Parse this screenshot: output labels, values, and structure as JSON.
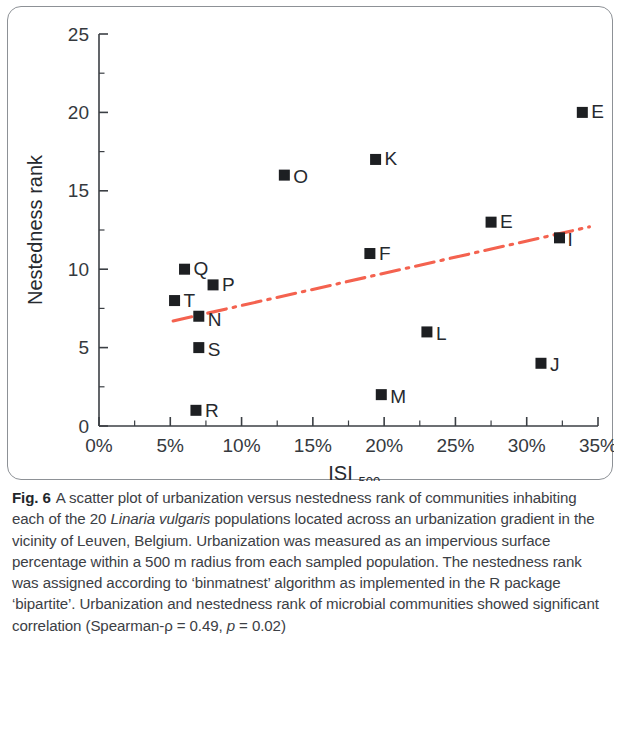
{
  "figure": {
    "number": "Fig. 6",
    "caption_part1": "A scatter plot of urbanization versus nestedness rank of communities inhabiting each of the 20 ",
    "caption_species": "Linaria vulgaris",
    "caption_part2": " populations located across an urbanization gradient in the vicinity of Leuven, Belgium. Urbanization was measured as an impervious surface percentage within a 500 m radius from each sampled population. The nestedness rank was assigned according to ‘binmatnest’ algorithm as implemented in the R package ‘bipartite’. Urbanization and nestedness rank of microbial communities showed significant correlation (Spearman-ρ = 0.49, ",
    "caption_pital": "p",
    "caption_part3": " = 0.02)"
  },
  "chart_data": {
    "type": "scatter",
    "title": "",
    "xlabel": "ISI",
    "xlabel_subscript": "500",
    "ylabel": "Nestedness rank",
    "xlim": [
      0,
      35
    ],
    "ylim": [
      0,
      25
    ],
    "x_ticks": [
      0,
      5,
      10,
      15,
      20,
      25,
      30,
      35
    ],
    "x_tick_labels": [
      "0%",
      "5%",
      "10%",
      "15%",
      "20%",
      "25%",
      "30%",
      "35%"
    ],
    "x_minor_step": 2.5,
    "y_ticks": [
      0,
      5,
      10,
      15,
      20,
      25
    ],
    "y_tick_labels": [
      "0",
      "5",
      "10",
      "15",
      "20",
      "25"
    ],
    "y_minor_step": 2.5,
    "grid": false,
    "legend": "none",
    "marker_shape": "square",
    "marker_color": "#1d1f22",
    "points": [
      {
        "label": "T",
        "x": 5.3,
        "y": 8,
        "lx": 9,
        "ly": -1
      },
      {
        "label": "Q",
        "x": 6.0,
        "y": 10,
        "lx": 9,
        "ly": -1
      },
      {
        "label": "R",
        "x": 6.8,
        "y": 1,
        "lx": 9,
        "ly": 0
      },
      {
        "label": "N",
        "x": 7.0,
        "y": 7,
        "lx": 9,
        "ly": 3
      },
      {
        "label": "S",
        "x": 7.0,
        "y": 5,
        "lx": 9,
        "ly": 1
      },
      {
        "label": "P",
        "x": 8.0,
        "y": 9,
        "lx": 9,
        "ly": -1
      },
      {
        "label": "O",
        "x": 13.0,
        "y": 16,
        "lx": 9,
        "ly": 1
      },
      {
        "label": "F",
        "x": 19.0,
        "y": 11,
        "lx": 9,
        "ly": -1
      },
      {
        "label": "K",
        "x": 19.4,
        "y": 17,
        "lx": 9,
        "ly": -1
      },
      {
        "label": "M",
        "x": 19.8,
        "y": 2,
        "lx": 9,
        "ly": 1
      },
      {
        "label": "L",
        "x": 23.0,
        "y": 6,
        "lx": 9,
        "ly": 1
      },
      {
        "label": "E",
        "x": 27.5,
        "y": 13,
        "lx": 9,
        "ly": -1
      },
      {
        "label": "J",
        "x": 31.0,
        "y": 4,
        "lx": 9,
        "ly": 1
      },
      {
        "label": "I",
        "x": 32.3,
        "y": 12,
        "lx": 8,
        "ly": 1
      },
      {
        "label": "E",
        "x": 33.9,
        "y": 20,
        "lx": 9,
        "ly": -1
      }
    ],
    "trend_line": {
      "style": "dash-dot",
      "color": "#f4624f",
      "x_start": 5.2,
      "y_start": 6.7,
      "x_end": 34.4,
      "y_end": 12.7
    },
    "annotations": {
      "spearman_rho": "0.49",
      "p_value": "0.02"
    }
  }
}
